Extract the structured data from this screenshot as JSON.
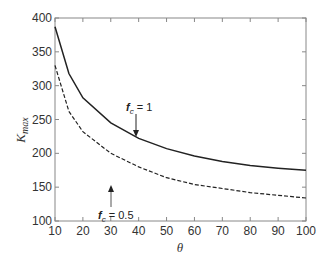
{
  "chart_data": {
    "type": "line",
    "title": "",
    "xlabel": "θ",
    "ylabel": "K_max",
    "xlim": [
      10,
      100
    ],
    "ylim": [
      100,
      400
    ],
    "x_ticks": [
      10,
      20,
      30,
      40,
      50,
      60,
      70,
      80,
      90,
      100
    ],
    "y_ticks": [
      100,
      150,
      200,
      250,
      300,
      350,
      400
    ],
    "grid": false,
    "legend": null,
    "x": [
      10,
      15,
      20,
      30,
      40,
      50,
      60,
      70,
      80,
      90,
      100
    ],
    "series": [
      {
        "name": "f_c = 1",
        "style": "solid",
        "values": [
          387,
          318,
          282,
          245,
          222,
          207,
          196,
          188,
          182,
          178,
          175
        ]
      },
      {
        "name": "f_c = 0.5",
        "style": "dashed",
        "values": [
          330,
          262,
          232,
          200,
          180,
          164,
          154,
          148,
          142,
          138,
          134
        ]
      }
    ],
    "annotations": [
      {
        "text_main": "f",
        "text_sub": "c",
        "text_rest": " = 1",
        "arrow_to": [
          40,
          222
        ],
        "direction": "down"
      },
      {
        "text_main": "f",
        "text_sub": "c",
        "text_rest": " = 0.5",
        "arrow_to": [
          30,
          200
        ],
        "direction": "up"
      }
    ]
  },
  "labels": {
    "x_axis": "θ",
    "y_axis_main": "K",
    "y_axis_sub": "max",
    "annot1_main": "f",
    "annot1_sub": "c",
    "annot1_rest": " = 1",
    "annot2_main": "f",
    "annot2_sub": "c",
    "annot2_rest": " = 0.5"
  }
}
